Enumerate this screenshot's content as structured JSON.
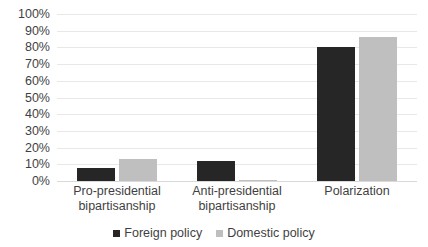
{
  "chart_data": {
    "type": "bar",
    "title": "",
    "subtitle": "",
    "xlabel": "",
    "ylabel": "",
    "ylim": [
      0,
      100
    ],
    "ytick_labels": [
      "100%",
      "90%",
      "80%",
      "70%",
      "60%",
      "50%",
      "40%",
      "30%",
      "20%",
      "10%",
      "0%"
    ],
    "ytick_values": [
      100,
      90,
      80,
      70,
      60,
      50,
      40,
      30,
      20,
      10,
      0
    ],
    "grid": true,
    "legend_position": "bottom",
    "categories": [
      "Pro-presidential bipartisanship",
      "Anti-presidential bipartisanship",
      "Polarization"
    ],
    "category_lines": [
      [
        "Pro-presidential",
        "bipartisanship"
      ],
      [
        "Anti-presidential",
        "bipartisanship"
      ],
      [
        "Polarization",
        ""
      ]
    ],
    "series": [
      {
        "name": "Foreign policy",
        "color": "#262626",
        "values": [
          8,
          12,
          80
        ]
      },
      {
        "name": "Domestic policy",
        "color": "#bfbfbf",
        "values": [
          13,
          0.5,
          86
        ]
      }
    ]
  },
  "colors": {
    "foreign_policy": "#262626",
    "domestic_policy": "#bfbfbf",
    "gridline": "#e8e8e8",
    "axis_text": "#3f3f3f",
    "background": "#ffffff"
  }
}
